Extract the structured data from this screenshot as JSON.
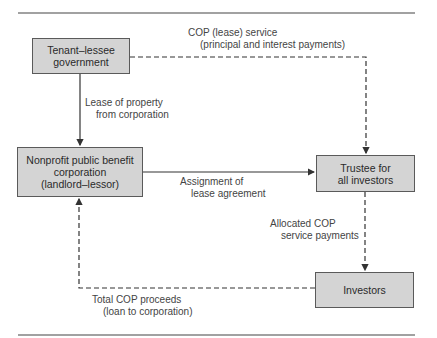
{
  "nodes": {
    "tenant": {
      "lines": [
        "Tenant–lessee",
        "government"
      ]
    },
    "nonprofit": {
      "lines": [
        "Nonprofit public benefit",
        "corporation",
        "(landlord–lessor)"
      ]
    },
    "trustee": {
      "lines": [
        "Trustee for",
        "all investors"
      ]
    },
    "investors": {
      "lines": [
        "Investors"
      ]
    }
  },
  "edges": {
    "cop_service": {
      "lines": [
        "COP (lease) service",
        "(principal and interest payments)"
      ],
      "style": "dashed"
    },
    "lease_property": {
      "lines": [
        "Lease of property",
        "from corporation"
      ],
      "style": "solid"
    },
    "assignment": {
      "lines": [
        "Assignment of",
        "lease agreement"
      ],
      "style": "solid"
    },
    "allocated": {
      "lines": [
        "Allocated COP",
        "service payments"
      ],
      "style": "dashed"
    },
    "total_proceeds": {
      "lines": [
        "Total COP proceeds",
        "(loan to corporation)"
      ],
      "style": "dashed"
    }
  },
  "colors": {
    "box_fill": "#d4d4d4",
    "line": "#333333"
  }
}
